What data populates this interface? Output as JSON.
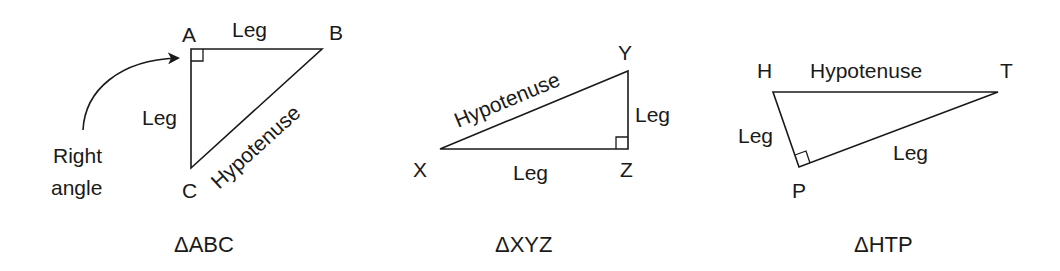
{
  "diagram": {
    "triangles": [
      {
        "caption": "ΔABC",
        "vertices": {
          "A": "A",
          "B": "B",
          "C": "C"
        },
        "right_angle_at": "A",
        "sides": {
          "AB": "Leg",
          "AC": "Leg",
          "BC": "Hypotenuse"
        },
        "annotation": {
          "line1": "Right",
          "line2": "angle"
        }
      },
      {
        "caption": "ΔXYZ",
        "vertices": {
          "X": "X",
          "Y": "Y",
          "Z": "Z"
        },
        "right_angle_at": "Z",
        "sides": {
          "XZ": "Leg",
          "YZ": "Leg",
          "XY": "Hypotenuse"
        }
      },
      {
        "caption": "ΔHTP",
        "vertices": {
          "H": "H",
          "T": "T",
          "P": "P"
        },
        "right_angle_at": "P",
        "sides": {
          "HP": "Leg",
          "PT": "Leg",
          "HT": "Hypotenuse"
        }
      }
    ],
    "colors": {
      "ink": "#1a1a1a",
      "background": "#ffffff"
    }
  }
}
